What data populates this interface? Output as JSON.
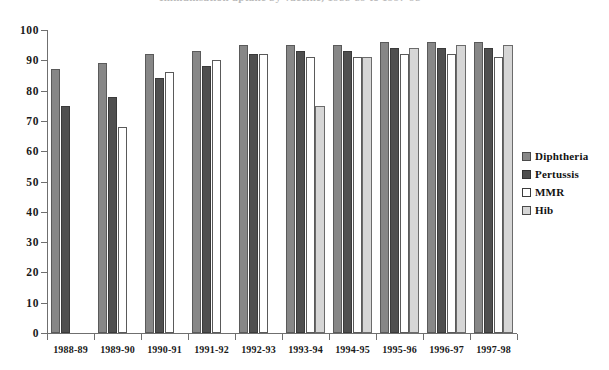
{
  "chart_data": {
    "type": "bar",
    "title": "Immunisation uptake by vaccine, 1988-89 to 1997-98",
    "title_clipped": true,
    "xlabel": "",
    "ylabel": "",
    "ylim": [
      0,
      100
    ],
    "yticks": [
      0,
      10,
      20,
      30,
      40,
      50,
      60,
      70,
      80,
      90,
      100
    ],
    "ytick_labels": [
      "0",
      "10",
      "20",
      "30",
      "40",
      "50",
      "60",
      "70",
      "80",
      "90",
      "100"
    ],
    "grid": false,
    "legend_position": "right",
    "categories": [
      "1988-89",
      "1989-90",
      "1990-91",
      "1991-92",
      "1992-93",
      "1993-94",
      "1994-95",
      "1995-96",
      "1996-97",
      "1997-98"
    ],
    "series": [
      {
        "name": "Diphtheria",
        "color": "#878787",
        "values": [
          87,
          89,
          92,
          93,
          95,
          95,
          95,
          96,
          96,
          96
        ]
      },
      {
        "name": "Pertussis",
        "color": "#4f4f4f",
        "values": [
          75,
          78,
          84,
          88,
          92,
          93,
          93,
          94,
          94,
          94
        ]
      },
      {
        "name": "MMR",
        "color": "#ffffff",
        "values": [
          null,
          68,
          86,
          90,
          92,
          91,
          91,
          92,
          92,
          91
        ]
      },
      {
        "name": "Hib",
        "color": "#d6d6d6",
        "values": [
          null,
          null,
          null,
          null,
          null,
          75,
          91,
          94,
          95,
          95
        ]
      }
    ]
  },
  "legend": {
    "items": [
      {
        "label": "Diphtheria",
        "swatch": "diphtheria"
      },
      {
        "label": "Pertussis",
        "swatch": "pertussis"
      },
      {
        "label": "MMR",
        "swatch": "mmr"
      },
      {
        "label": "Hib",
        "swatch": "hib"
      }
    ]
  },
  "colors": {
    "diphtheria": "#878787",
    "pertussis": "#4f4f4f",
    "mmr": "#ffffff",
    "hib": "#d6d6d6",
    "axis": "#6f6f6f",
    "text": "#1a1a1a",
    "background": "#ffffff"
  }
}
